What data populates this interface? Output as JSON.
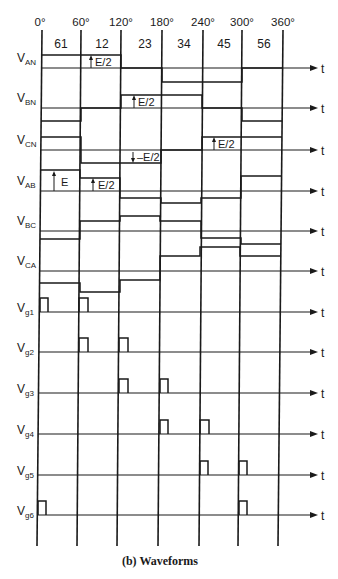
{
  "diagram": {
    "caption": "(b) Waveforms",
    "angle_labels": [
      "0°",
      "60°",
      "120°",
      "180°",
      "240°",
      "300°",
      "360°"
    ],
    "interval_labels": [
      "61",
      "12",
      "23",
      "34",
      "45",
      "56"
    ],
    "time_axis_label": "t",
    "signals": [
      {
        "name": "V",
        "sub": "AN"
      },
      {
        "name": "V",
        "sub": "BN"
      },
      {
        "name": "V",
        "sub": "CN"
      },
      {
        "name": "V",
        "sub": "AB"
      },
      {
        "name": "V",
        "sub": "BC"
      },
      {
        "name": "V",
        "sub": "CA"
      },
      {
        "name": "V",
        "sub": "g1"
      },
      {
        "name": "V",
        "sub": "g2"
      },
      {
        "name": "V",
        "sub": "g3"
      },
      {
        "name": "V",
        "sub": "g4"
      },
      {
        "name": "V",
        "sub": "g5"
      },
      {
        "name": "V",
        "sub": "g6"
      }
    ],
    "annotations": {
      "van_step": "E/2",
      "vbn_step": "E/2",
      "vcn_pos_step": "E/2",
      "vcn_neg_step": "–E/2",
      "vab_full": "E",
      "vab_half": "E/2"
    },
    "gate_pulses": {
      "g1": [
        "0°",
        "60°"
      ],
      "g2": [
        "60°",
        "120°"
      ],
      "g3": [
        "120°",
        "180°"
      ],
      "g4": [
        "180°",
        "240°"
      ],
      "g5": [
        "240°",
        "300°"
      ],
      "g6": [
        "0°",
        "300°"
      ]
    },
    "phase_levels": {
      "V_AN": [
        "+E/2",
        "+E/2",
        "0",
        "-E/2",
        "-E/2",
        "0"
      ],
      "V_BN": [
        "-E/2",
        "0",
        "+E/2",
        "+E/2",
        "0",
        "-E/2"
      ],
      "V_CN": [
        "+E/2",
        "-E/2",
        "-E/2",
        "0",
        "+E/2",
        "+E/2"
      ],
      "V_AB": [
        "E",
        "E/2",
        "-E/2",
        "-E",
        "-E/2",
        "E/2"
      ]
    },
    "colors": {
      "ink": "#1a1a1a",
      "background": "#ffffff"
    }
  }
}
